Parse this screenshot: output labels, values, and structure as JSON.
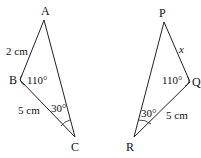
{
  "triangle_abc": {
    "vertices": {
      "A": "A",
      "B": "B",
      "C": "C"
    },
    "side_ab": "2 cm",
    "side_bc": "5 cm",
    "angle_b": "110°",
    "angle_c": "30°"
  },
  "triangle_pqr": {
    "vertices": {
      "P": "P",
      "Q": "Q",
      "R": "R"
    },
    "side_pq": "x",
    "side_qr": "5 cm",
    "angle_q": "110°",
    "angle_r": "30°"
  },
  "colors": {
    "stroke": "#222222",
    "background": "#ffffff"
  }
}
